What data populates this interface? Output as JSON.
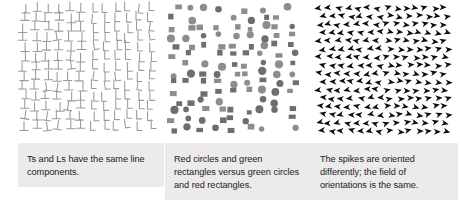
{
  "figure": {
    "panel_count": 3,
    "background": "#ffffff",
    "caption_background": "#eceaea",
    "caption_text_color": "#1b1b1b"
  },
  "panels": [
    {
      "id": "ts-and-ls",
      "stimulus_name": "t-and-l-search-array",
      "caption": "Ts and Ls have the same line components.",
      "shape_left": "T",
      "shape_right": "L",
      "shape_color": "#9a9a9a"
    },
    {
      "id": "color-shape-conjunction",
      "stimulus_name": "circle-and-rectangle-search-array",
      "caption": "Red circles and green rectangles versus green circles and red rectangles.",
      "shape_left": "circle",
      "shape_right": "rectangle",
      "color_a": "#6e6e6e",
      "color_b": "#8d8d8d"
    },
    {
      "id": "spike-orientation",
      "stimulus_name": "spike-orientation-search-array",
      "caption": "The spikes are oriented differently; the field of orientations is the same.",
      "shape_left": "left-pointing-spike",
      "shape_right": "right-pointing-spike",
      "shape_color": "#0d0d0d"
    }
  ]
}
